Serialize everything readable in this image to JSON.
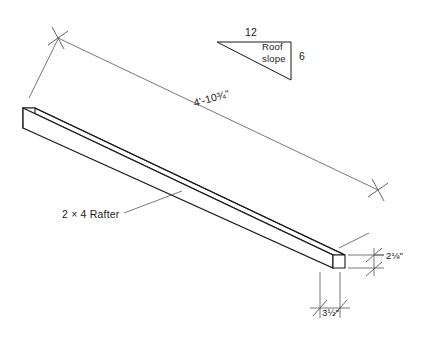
{
  "drawing": {
    "title": "2 x 4 Rafter isometric detail drawing",
    "line_color": "#1a1a1a",
    "thin_line_color": "#555555",
    "background": "#ffffff"
  },
  "rafter": {
    "member_label": "2 × 4 Rafter",
    "length_label": "4'-10¾\"",
    "length_feet": 4,
    "length_inches": "10¾",
    "end_depth_label": "2⅛\"",
    "end_width_label": "3½\""
  },
  "slope_symbol": {
    "caption_line1": "Roof",
    "caption_line2": "slope",
    "run_label": "12",
    "rise_label": "6",
    "run_value": 12,
    "rise_value": 6
  },
  "dimensions": [
    {
      "name": "overall-length",
      "value": "4'-10¾\""
    },
    {
      "name": "end-depth",
      "value": "2⅛\""
    },
    {
      "name": "end-width",
      "value": "3½\""
    }
  ]
}
